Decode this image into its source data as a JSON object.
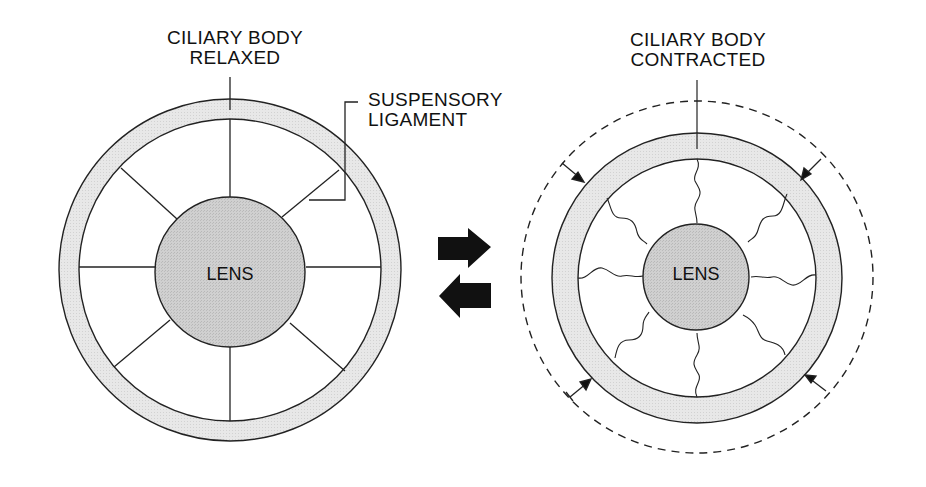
{
  "diagram": {
    "type": "lens accommodation schematic",
    "colors": {
      "ring_fill": "#e6e6e6",
      "lens_fill": "#cfcfcf",
      "stroke": "#222222",
      "background": "#ffffff"
    },
    "left_panel": {
      "state": "relaxed",
      "labels": {
        "ciliary_line1": "CILIARY BODY",
        "ciliary_line2": "RELAXED",
        "ligament_line1": "SUSPENSORY",
        "ligament_line2": "LIGAMENT",
        "lens": "LENS"
      },
      "ligament_style": "straight",
      "ligament_count": 8
    },
    "center": {
      "arrows": [
        {
          "direction": "right"
        },
        {
          "direction": "left"
        }
      ]
    },
    "right_panel": {
      "state": "contracted",
      "labels": {
        "ciliary_line1": "CILIARY BODY",
        "ciliary_line2": "CONTRACTED",
        "lens": "LENS"
      },
      "ligament_style": "wavy (slack)",
      "ligament_count": 8,
      "dashed_outline": "previous relaxed ring position",
      "inward_arrows": 4
    }
  }
}
